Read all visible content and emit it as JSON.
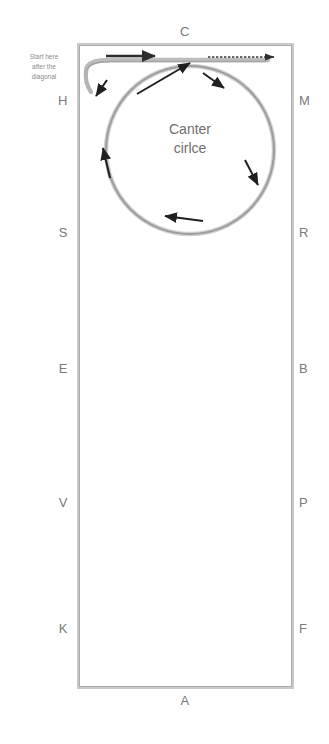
{
  "diagram": {
    "arena": {
      "border_color": "#b9b9b9",
      "fill_color": "#ffffff"
    },
    "letters": {
      "top": [
        {
          "label": "C",
          "x": 185,
          "y": 31
        }
      ],
      "bottom": [
        {
          "label": "A",
          "x": 185,
          "y": 700
        }
      ],
      "left": [
        {
          "label": "H",
          "x": 66,
          "y": 100
        },
        {
          "label": "S",
          "x": 66,
          "y": 232
        },
        {
          "label": "E",
          "x": 66,
          "y": 368
        },
        {
          "label": "V",
          "x": 66,
          "y": 502
        },
        {
          "label": "K",
          "x": 66,
          "y": 628
        }
      ],
      "right": [
        {
          "label": "M",
          "x": 301,
          "y": 100
        },
        {
          "label": "R",
          "x": 301,
          "y": 232
        },
        {
          "label": "B",
          "x": 301,
          "y": 368
        },
        {
          "label": "P",
          "x": 301,
          "y": 502
        },
        {
          "label": "F",
          "x": 301,
          "y": 628
        }
      ]
    },
    "circle": {
      "label_lines": [
        "Canter",
        "cirlce"
      ],
      "center_x": 190,
      "center_y": 150,
      "radius": 84,
      "stroke_color": "#a8a8a8"
    },
    "annotation": {
      "lines": [
        "Start here",
        "after the",
        "diagonal"
      ],
      "color": "#8a8a8a"
    },
    "arrows": {
      "color": "#2e2e2e",
      "track_arrow_left_label": "track-arrow-left",
      "track_arrow_right_label": "track-arrow-right",
      "circle_arrow_labels": [
        "circle-arrow-upper-left",
        "circle-arrow-inner-diagonal",
        "circle-arrow-upper-right",
        "circle-arrow-right",
        "circle-arrow-left",
        "circle-arrow-bottom"
      ]
    }
  }
}
